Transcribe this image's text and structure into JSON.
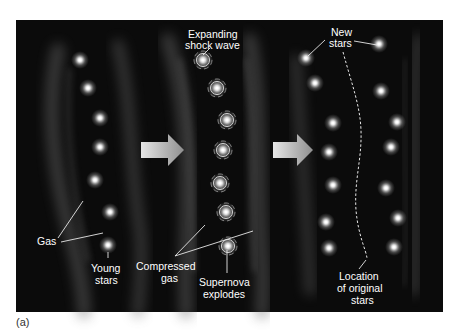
{
  "figure": {
    "caption": "(a)",
    "panel_background": "#0a0a0a",
    "gas_color": "#7a7a7a",
    "star_color": "#ffffff",
    "arrow_color": "#b8b8b8",
    "stages": [
      {
        "id": "before",
        "labels": {
          "gas": "Gas",
          "young_stars_line1": "Young",
          "young_stars_line2": "stars"
        },
        "stars": [
          [
            80,
            60
          ],
          [
            88,
            88
          ],
          [
            100,
            118
          ],
          [
            100,
            147
          ],
          [
            95,
            180
          ],
          [
            110,
            212
          ],
          [
            108,
            245
          ]
        ]
      },
      {
        "id": "supernova",
        "labels": {
          "shock_line1": "Expanding",
          "shock_line2": "shock wave",
          "compressed_line1": "Compressed",
          "compressed_line2": "gas",
          "supernova_line1": "Supernova",
          "supernova_line2": "explodes"
        },
        "stars": [
          [
            203,
            60
          ],
          [
            217,
            88
          ],
          [
            227,
            120
          ],
          [
            223,
            150
          ],
          [
            220,
            183
          ],
          [
            226,
            212
          ],
          [
            228,
            246
          ]
        ]
      },
      {
        "id": "after",
        "labels": {
          "new_stars_line1": "New",
          "new_stars_line2": "stars",
          "location_line1": "Location",
          "location_line2": "of original",
          "location_line3": "stars"
        },
        "stars_left": [
          [
            306,
            58
          ],
          [
            315,
            83
          ],
          [
            333,
            123
          ],
          [
            329,
            152
          ],
          [
            333,
            185
          ],
          [
            326,
            222
          ],
          [
            329,
            248
          ]
        ],
        "stars_right": [
          [
            379,
            44
          ],
          [
            381,
            91
          ],
          [
            397,
            122
          ],
          [
            391,
            147
          ],
          [
            386,
            188
          ],
          [
            398,
            218
          ],
          [
            394,
            247
          ]
        ]
      }
    ]
  }
}
